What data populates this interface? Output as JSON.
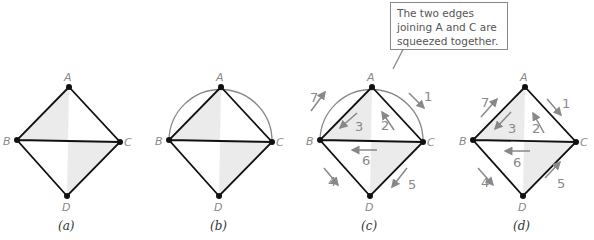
{
  "figure": {
    "panels": [
      {
        "id": "a",
        "caption": "(a)",
        "vertices": [
          "A",
          "B",
          "C",
          "D"
        ]
      },
      {
        "id": "b",
        "caption": "(b)",
        "vertices": [
          "A",
          "B",
          "C",
          "D"
        ]
      },
      {
        "id": "c",
        "caption": "(c)",
        "vertices": [
          "A",
          "B",
          "C",
          "D"
        ],
        "edge_numbers": [
          "1",
          "2",
          "3",
          "4",
          "5",
          "6",
          "7"
        ]
      },
      {
        "id": "d",
        "caption": "(d)",
        "vertices": [
          "A",
          "B",
          "C",
          "D"
        ],
        "edge_numbers": [
          "1",
          "2",
          "3",
          "4",
          "5",
          "6",
          "7"
        ]
      }
    ],
    "callout": {
      "text": "The two edges joining A and C are squeezed together."
    },
    "colors": {
      "fill": "#ebebeb",
      "edge": "#111111",
      "arrow": "#888888",
      "arc": "#888888"
    }
  }
}
